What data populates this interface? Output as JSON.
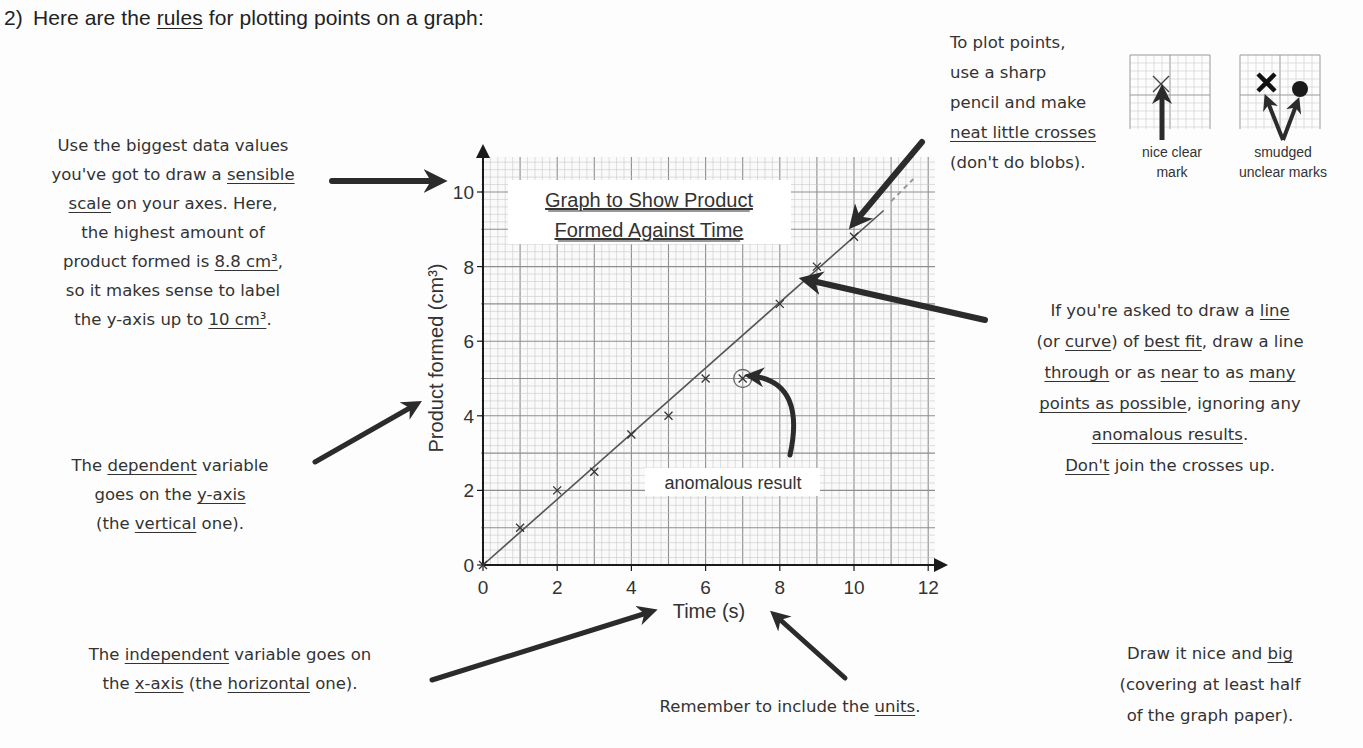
{
  "heading": {
    "number": "2)",
    "pre": "Here are the ",
    "underlined": "rules",
    "post": " for plotting points on a graph:"
  },
  "notes": {
    "scale": [
      [
        "Use the biggest data values"
      ],
      [
        "you've got to draw a ",
        {
          "u": "sensible"
        }
      ],
      [
        {
          "u": "scale"
        },
        " on your axes.  Here,"
      ],
      [
        "the highest amount of"
      ],
      [
        "product formed is ",
        {
          "u": "8.8 cm³"
        },
        ","
      ],
      [
        "so it makes sense to label"
      ],
      [
        "the y-axis up to ",
        {
          "u": "10 cm³"
        },
        "."
      ]
    ],
    "dependent": [
      [
        "The ",
        {
          "u": "dependent"
        },
        " variable"
      ],
      [
        "goes on the ",
        {
          "u": "y-axis"
        }
      ],
      [
        "(the ",
        {
          "u": "vertical"
        },
        " one)."
      ]
    ],
    "independent": [
      [
        "The ",
        {
          "u": "independent"
        },
        " variable goes on"
      ],
      [
        "the ",
        {
          "u": "x-axis"
        },
        " (the ",
        {
          "u": "horizontal"
        },
        " one)."
      ]
    ],
    "units": [
      [
        "Remember to include the ",
        {
          "u": "units"
        },
        "."
      ]
    ],
    "plot_points": [
      [
        "To plot points,"
      ],
      [
        "use a sharp"
      ],
      [
        "pencil and make"
      ],
      [
        {
          "u": "neat little crosses"
        }
      ],
      [
        "(don't do blobs)."
      ]
    ],
    "best_fit": [
      [
        "If you're asked to draw a ",
        {
          "u": "line"
        }
      ],
      [
        "(or ",
        {
          "u": "curve"
        },
        ") of ",
        {
          "u": "best fit"
        },
        ", draw a line"
      ],
      [
        {
          "u": "through"
        },
        " or as ",
        {
          "u": "near"
        },
        " to as ",
        {
          "u": "many"
        }
      ],
      [
        {
          "u": "points as possible"
        },
        ", ignoring any"
      ],
      [
        {
          "u": "anomalous results"
        },
        "."
      ],
      [
        {
          "u": "Don't"
        },
        " join the crosses up."
      ]
    ],
    "big": [
      [
        "Draw it nice and ",
        {
          "u": "big"
        }
      ],
      [
        "(covering at least half"
      ],
      [
        "of the graph paper)."
      ]
    ]
  },
  "mark_examples": {
    "good_label": [
      "nice clear",
      "mark"
    ],
    "bad_label": [
      "smudged",
      "unclear marks"
    ]
  },
  "colors": {
    "grid_minor": "#c9c9c9",
    "grid_major": "#8e8e8e",
    "axis": "#1a1a1a",
    "arrow": "#2b2b2b",
    "line": "#555555",
    "text": "#333333"
  },
  "chart_data": {
    "type": "scatter",
    "title_lines": [
      "Graph to Show Product",
      "Formed Against Time"
    ],
    "xlabel": "Time (s)",
    "ylabel": "Product formed (cm³)",
    "xlim": [
      0,
      12
    ],
    "ylim": [
      0,
      10
    ],
    "xticks": [
      0,
      2,
      4,
      6,
      8,
      10,
      12
    ],
    "yticks": [
      0,
      2,
      4,
      6,
      8,
      10
    ],
    "grid": true,
    "series": [
      {
        "name": "Product formed",
        "marker": "x",
        "x": [
          0,
          1,
          2,
          3,
          4,
          5,
          6,
          7,
          8,
          9,
          10
        ],
        "y": [
          0,
          1,
          2,
          2.5,
          3.5,
          4,
          5,
          5,
          7,
          8,
          8.8
        ]
      }
    ],
    "best_fit_line": {
      "slope": 0.88,
      "intercept": 0,
      "x_range": [
        0,
        10.8
      ]
    },
    "anomalous_points": [
      {
        "x": 7,
        "y": 5,
        "label": "anomalous result"
      }
    ]
  }
}
